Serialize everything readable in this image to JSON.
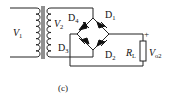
{
  "figure": {
    "caption": "(c)"
  },
  "labels": {
    "v1": {
      "main": "V",
      "sub": "1"
    },
    "v2": {
      "main": "V",
      "sub": "2"
    },
    "d1": {
      "main": "D",
      "sub": "1"
    },
    "d2": {
      "main": "D",
      "sub": "2"
    },
    "d3": {
      "main": "D",
      "sub": "3"
    },
    "d4": {
      "main": "D",
      "sub": "4"
    },
    "rl": {
      "main": "R",
      "sub": "L"
    },
    "vo": {
      "main": "V",
      "sub": "o2"
    },
    "plus": "+"
  },
  "components": [
    "transformer",
    "diode-D1",
    "diode-D2",
    "diode-D3",
    "diode-D4",
    "load-resistor-RL"
  ],
  "colors": {
    "line": "#222222",
    "background": "#ffffff"
  }
}
